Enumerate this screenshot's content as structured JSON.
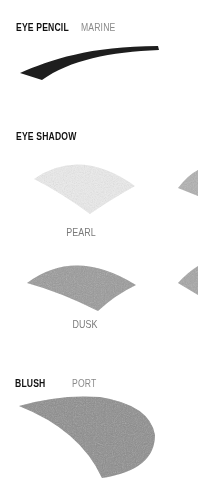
{
  "sections": {
    "eye_pencil": {
      "title": "EYE PENCIL",
      "shade": "MARINE",
      "color": "#1e1e1e"
    },
    "eye_shadow": {
      "title": "EYE SHADOW",
      "swatches": [
        {
          "name": "PEARL",
          "color": "#ececec"
        },
        {
          "name": "DUSK",
          "color": "#9a9a9a"
        }
      ],
      "partial_swatch_colors": [
        "#b0b0b0",
        "#a5a5a5"
      ]
    },
    "blush": {
      "title": "BLUSH",
      "shade": "PORT",
      "color": "#8c8c8c"
    }
  }
}
